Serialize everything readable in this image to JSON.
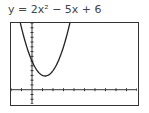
{
  "equation": "y = 2x² − 5x + 6",
  "chart_data": {
    "type": "line",
    "title": "y = 2x² − 5x + 6",
    "xlabel": "",
    "ylabel": "",
    "xlim": [
      -2,
      10
    ],
    "ylim": [
      -3,
      14
    ],
    "x_scale": 1,
    "y_scale": 1,
    "grid": false,
    "series": [
      {
        "name": "y = 2x^2 - 5x + 6",
        "x": [
          -1,
          -0.5,
          0,
          0.5,
          1,
          1.25,
          1.5,
          2,
          2.5,
          3,
          3.5
        ],
        "y": [
          13,
          9,
          6,
          4,
          3,
          2.875,
          3,
          4,
          6,
          9,
          13
        ]
      }
    ],
    "vertex": [
      1.25,
      2.875
    ],
    "y_intercept": 6
  }
}
